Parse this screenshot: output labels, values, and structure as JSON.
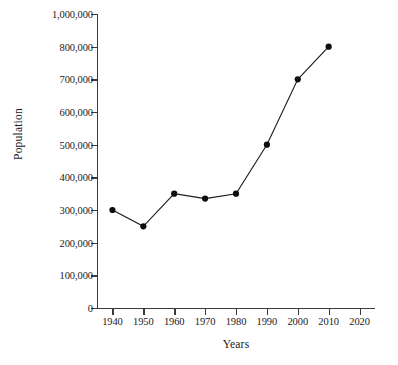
{
  "chart_data": {
    "type": "line",
    "title": "",
    "xlabel": "Years",
    "ylabel": "Population",
    "x": [
      1940,
      1950,
      1960,
      1970,
      1980,
      1990,
      2000,
      2010
    ],
    "values": [
      300000,
      250000,
      350000,
      335000,
      350000,
      500000,
      700000,
      800000
    ],
    "series": [
      {
        "name": "Population",
        "x": [
          1940,
          1950,
          1960,
          1970,
          1980,
          1990,
          2000,
          2010
        ],
        "values": [
          300000,
          250000,
          350000,
          335000,
          350000,
          500000,
          700000,
          800000
        ]
      }
    ],
    "xtick_labels": [
      "1940",
      "1950",
      "1960",
      "1970",
      "1980",
      "1990",
      "2000",
      "2010",
      "2020"
    ],
    "xtick_values": [
      1940,
      1950,
      1960,
      1970,
      1980,
      1990,
      2000,
      2010,
      2020
    ],
    "ytick_labels": [
      "0",
      "100,000",
      "200,000",
      "300,000",
      "400,000",
      "500,000",
      "600,000",
      "700,000",
      "800,000",
      "1,000,000"
    ],
    "ytick_values": [
      0,
      100000,
      200000,
      300000,
      400000,
      500000,
      600000,
      700000,
      800000,
      1000000
    ],
    "xlim": [
      1935,
      2025
    ],
    "ylim": [
      0,
      1000000
    ],
    "grid": false,
    "legend": false,
    "legend_position": "none",
    "axis_note": "y-axis scale is non-uniform: the 900,000 tick is omitted, 1,000,000 is drawn one even step above 800,000",
    "marker": "filled-circle",
    "line_color": "#1a1a1a",
    "marker_color": "#0d0d0d",
    "background_color": "#ffffff"
  },
  "ghost_header": ""
}
